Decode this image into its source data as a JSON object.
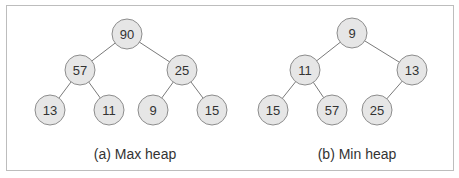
{
  "diagrams": [
    {
      "caption": "(a) Max heap",
      "nodes": [
        {
          "id": "n1",
          "label": "90",
          "x": 127,
          "y": 34
        },
        {
          "id": "n2",
          "label": "57",
          "x": 80,
          "y": 70
        },
        {
          "id": "n3",
          "label": "25",
          "x": 182,
          "y": 70
        },
        {
          "id": "n4",
          "label": "13",
          "x": 50,
          "y": 110
        },
        {
          "id": "n5",
          "label": "11",
          "x": 109,
          "y": 110
        },
        {
          "id": "n6",
          "label": "9",
          "x": 153,
          "y": 110
        },
        {
          "id": "n7",
          "label": "15",
          "x": 212,
          "y": 110
        }
      ],
      "edges": [
        [
          "n1",
          "n2"
        ],
        [
          "n1",
          "n3"
        ],
        [
          "n2",
          "n4"
        ],
        [
          "n2",
          "n5"
        ],
        [
          "n3",
          "n6"
        ],
        [
          "n3",
          "n7"
        ]
      ]
    },
    {
      "caption": "(b) Min heap",
      "nodes": [
        {
          "id": "m1",
          "label": "9",
          "x": 352,
          "y": 33
        },
        {
          "id": "m2",
          "label": "11",
          "x": 305,
          "y": 70
        },
        {
          "id": "m3",
          "label": "13",
          "x": 412,
          "y": 70
        },
        {
          "id": "m4",
          "label": "15",
          "x": 273,
          "y": 110
        },
        {
          "id": "m5",
          "label": "57",
          "x": 332,
          "y": 110
        },
        {
          "id": "m6",
          "label": "25",
          "x": 377,
          "y": 110
        }
      ],
      "edges": [
        [
          "m1",
          "m2"
        ],
        [
          "m1",
          "m3"
        ],
        [
          "m2",
          "m4"
        ],
        [
          "m2",
          "m5"
        ],
        [
          "m3",
          "m6"
        ]
      ]
    }
  ],
  "style": {
    "node_fill": "#e6e6e6",
    "node_stroke": "#8c8c8c",
    "edge_color": "#7a7a7a",
    "text_color": "#333333",
    "radius": 15
  }
}
